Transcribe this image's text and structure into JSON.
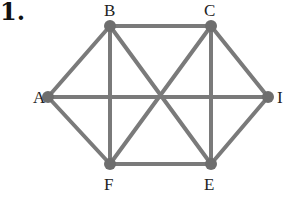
{
  "problem_number": "1.",
  "graph": {
    "edge_color": "#7a7a7a",
    "vertex_color": "#6e6e6e",
    "vertices": [
      {
        "id": "A",
        "x": 48,
        "y": 97,
        "lx": 33,
        "ly": 103
      },
      {
        "id": "B",
        "x": 110,
        "y": 26,
        "lx": 104,
        "ly": 16
      },
      {
        "id": "C",
        "x": 211,
        "y": 26,
        "lx": 204,
        "ly": 16
      },
      {
        "id": "I",
        "x": 268,
        "y": 97,
        "lx": 277,
        "ly": 103
      },
      {
        "id": "E",
        "x": 211,
        "y": 164,
        "lx": 204,
        "ly": 190
      },
      {
        "id": "F",
        "x": 110,
        "y": 164,
        "lx": 104,
        "ly": 190
      }
    ],
    "edges": [
      [
        "A",
        "B"
      ],
      [
        "A",
        "F"
      ],
      [
        "A",
        "I"
      ],
      [
        "B",
        "C"
      ],
      [
        "B",
        "F"
      ],
      [
        "B",
        "E"
      ],
      [
        "C",
        "F"
      ],
      [
        "C",
        "E"
      ],
      [
        "C",
        "I"
      ],
      [
        "F",
        "E"
      ],
      [
        "E",
        "I"
      ]
    ]
  }
}
